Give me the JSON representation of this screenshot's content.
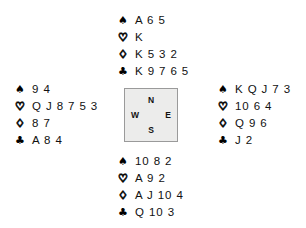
{
  "diagram": {
    "type": "bridge-deal-diagram",
    "suit_symbols": {
      "spade": "♠",
      "heart": "♡",
      "diamond": "♢",
      "club": "♣"
    },
    "compass": {
      "north": "N",
      "west": "W",
      "east": "E",
      "south": "S",
      "fill_color": "#ececeb",
      "border_color": "#9a9a9a"
    },
    "hands": {
      "north": {
        "position_label": "North",
        "spades": "A 6 5",
        "hearts": "K",
        "diamonds": "K 5 3 2",
        "clubs": "K 9 7 6 5"
      },
      "west": {
        "position_label": "West",
        "spades": "9 4",
        "hearts": "Q J 8 7 5 3",
        "diamonds": "8 7",
        "clubs": "A 8 4"
      },
      "east": {
        "position_label": "East",
        "spades": "K Q J 7 3",
        "hearts": "10 6 4",
        "diamonds": "Q 9 6",
        "clubs": "J 2"
      },
      "south": {
        "position_label": "South",
        "spades": "10 8 2",
        "hearts": "A 9 2",
        "diamonds": "A J 10 4",
        "clubs": "Q 10 3"
      }
    }
  }
}
